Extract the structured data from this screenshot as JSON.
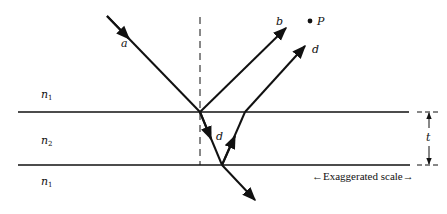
{
  "diagram": {
    "media": [
      {
        "id": "top",
        "label": "n",
        "sub": "1"
      },
      {
        "id": "film",
        "label": "n",
        "sub": "2"
      },
      {
        "id": "bottom",
        "label": "n",
        "sub": "1"
      }
    ],
    "rays": {
      "incident": "a",
      "reflected_top": "b",
      "inside_film": "d",
      "emerging": "d"
    },
    "point_label": "P",
    "thickness_label": "t",
    "scale_note": "←Exaggerated scale→",
    "colors": {
      "line": "#111111",
      "background": "#ffffff"
    }
  }
}
